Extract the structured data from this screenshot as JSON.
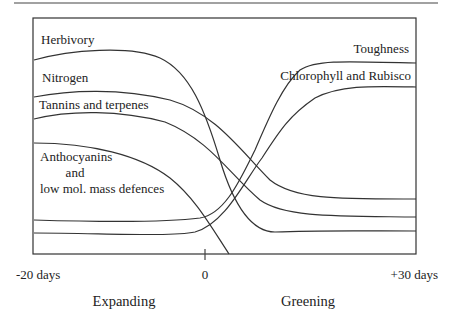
{
  "diagram": {
    "frame": {
      "x": 33,
      "y": 18,
      "width": 383,
      "height": 236
    },
    "top_rule": {
      "x1": 14,
      "x2": 438,
      "y": 3
    },
    "x_axis": {
      "ticks": [
        {
          "label": "-20 days",
          "x": 16,
          "anchor": "start"
        },
        {
          "label": "0",
          "x": 205,
          "anchor": "middle",
          "tick": true
        },
        {
          "label": "+30 days",
          "x": 438,
          "anchor": "end"
        }
      ],
      "phases": [
        {
          "label": "Expanding",
          "x": 124
        },
        {
          "label": "Greening",
          "x": 308
        }
      ]
    },
    "curves": [
      {
        "name": "Herbivory",
        "trend": "high during expansion, falls sharply to low after day 0",
        "path": "M34,60 C70,50 130,45 160,58 C190,72 205,110 220,160 C232,200 250,232 275,232 C320,230 370,231 416,231"
      },
      {
        "name": "Nitrogen",
        "trend": "high, declining after day 0",
        "path": "M34,97 C70,90 120,88 170,100 C215,113 240,150 270,180 C295,200 340,199 416,199"
      },
      {
        "name": "Tannins and terpenes",
        "trend": "moderately high, declining after day 0",
        "path": "M34,119 C70,110 120,110 165,122 C210,140 230,175 260,200 C285,218 340,216 416,217"
      },
      {
        "name": "Anthocyanins and low mol. mass defences",
        "trend": "moderate, declining to zero shortly after day 0",
        "path": "M34,143 C90,143 140,155 170,178 C195,198 210,225 229,254"
      },
      {
        "name": "Toughness",
        "trend": "low during expansion, rises steeply after day 0",
        "path": "M34,220 C100,222 170,222 200,218 C225,214 240,180 255,150 C270,115 283,85 300,70 C315,60 340,61 416,63"
      },
      {
        "name": "Chlorophyll and Rubisco",
        "trend": "very low during expansion, rises after day 0",
        "path": "M34,233 C100,233 170,237 195,232 C225,224 245,180 262,158 C280,130 290,115 315,98 C340,85 370,86 416,87"
      }
    ],
    "labels": [
      {
        "text": "Herbivory",
        "x": 41,
        "y": 44,
        "anchor": "start"
      },
      {
        "text": "Nitrogen",
        "x": 42,
        "y": 82,
        "anchor": "start"
      },
      {
        "text": "Tannins and terpenes",
        "x": 39,
        "y": 109,
        "anchor": "start"
      },
      {
        "text": "Anthocyanins",
        "x": 40,
        "y": 161,
        "anchor": "start"
      },
      {
        "text": "and",
        "x": 75,
        "y": 177,
        "anchor": "middle"
      },
      {
        "text": "low mol. mass defences",
        "x": 40,
        "y": 193,
        "anchor": "start"
      },
      {
        "text": "Toughness",
        "x": 409,
        "y": 53,
        "anchor": "end"
      },
      {
        "text": "Chlorophyll and Rubisco",
        "x": 411,
        "y": 80,
        "anchor": "end"
      }
    ]
  }
}
